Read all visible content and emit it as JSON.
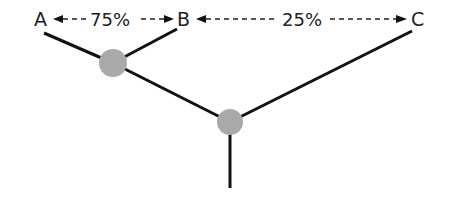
{
  "diagram": {
    "type": "phylogenetic-tree",
    "leaves": [
      {
        "id": "A",
        "label": "A"
      },
      {
        "id": "B",
        "label": "B"
      },
      {
        "id": "C",
        "label": "C"
      }
    ],
    "internal_nodes": [
      {
        "id": "node-AB",
        "children": [
          "A",
          "B"
        ]
      },
      {
        "id": "node-root",
        "children": [
          "node-AB",
          "C"
        ]
      }
    ],
    "distances": [
      {
        "from": "A",
        "to": "B",
        "label": "75%"
      },
      {
        "from": "B",
        "to": "C",
        "label": "25%"
      }
    ],
    "colors": {
      "line": "#111111",
      "node_fill": "#a9a9a9",
      "text": "#222222",
      "background": "#ffffff"
    }
  }
}
